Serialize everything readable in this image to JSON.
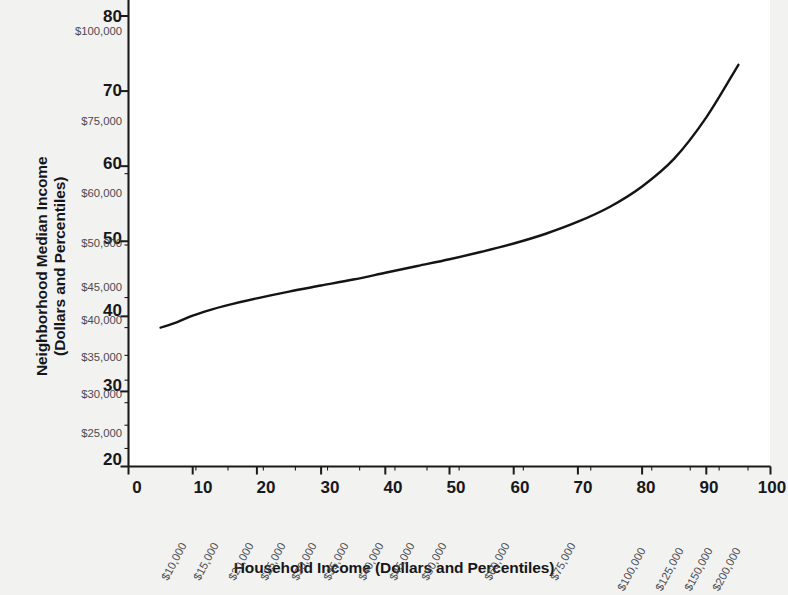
{
  "chart_data": {
    "type": "line",
    "title": "",
    "xlabel": "Household Income (Dollars and Percentiles)",
    "ylabel": "Neighborhood Median Income (Dollars and Percentiles)",
    "xlim": [
      0,
      100
    ],
    "ylim": [
      20,
      80
    ],
    "grid": false,
    "legend": "none",
    "x_tick_labels_percentile": [
      "0",
      "10",
      "20",
      "30",
      "40",
      "50",
      "60",
      "70",
      "80",
      "90",
      "100"
    ],
    "x_tick_values_percentile": [
      0,
      10,
      20,
      30,
      40,
      50,
      60,
      70,
      80,
      90,
      100
    ],
    "x_tick_labels_dollar": [
      "$10,000",
      "$15,000",
      "$20,000",
      "$25,000",
      "$30,000",
      "$35,000",
      "$40,000",
      "$45,000",
      "$50,000",
      "$60,000",
      "$75,000",
      "$100,000",
      "$125,000",
      "$150,000",
      "$200,000"
    ],
    "x_tick_dollar_positions": [
      10.5,
      15.5,
      21.0,
      26.0,
      31.0,
      36.0,
      41.5,
      46.5,
      51.5,
      61.5,
      72.0,
      81.5,
      87.5,
      92.0,
      96.5
    ],
    "y_tick_labels_percentile": [
      "20",
      "30",
      "40",
      "50",
      "60",
      "70",
      "80"
    ],
    "y_tick_values_percentile": [
      20,
      30,
      40,
      50,
      60,
      70,
      80
    ],
    "y_tick_labels_dollar": [
      "$25,000",
      "$30,000",
      "$35,000",
      "$40,000",
      "$45,000",
      "$50,000",
      "$60,000",
      "$75,000",
      "$100,000"
    ],
    "y_tick_dollar_positions": [
      22.4,
      25.5,
      28.5,
      31.5,
      34.8,
      38.5,
      42.5,
      49.5,
      59.0
    ],
    "series": [
      {
        "name": "Neighborhood median income by household income percentile",
        "x": [
          5.0,
          7.5,
          10,
          12.5,
          15,
          20,
          25,
          30,
          35,
          40,
          45,
          50,
          55,
          60,
          65,
          70,
          75,
          80,
          85,
          90,
          95
        ],
        "y": [
          38.5,
          39.2,
          40.1,
          40.8,
          41.4,
          42.4,
          43.3,
          44.1,
          44.9,
          45.8,
          46.7,
          47.6,
          48.6,
          49.7,
          51.0,
          52.6,
          54.6,
          57.3,
          61.0,
          66.5,
          73.5
        ]
      }
    ]
  },
  "axes": {
    "y_title": "Neighborhood Median Income\n(Dollars and Percentiles)",
    "y_title_line1": "Neighborhood Median Income",
    "y_title_line2": "(Dollars and Percentiles)",
    "x_title": "Household Income (Dollars and Percentiles)"
  },
  "colors": {
    "background": "#f2f2f0",
    "plot_background": "#ffffff",
    "axis": "#1a1a1a",
    "curve": "#141418",
    "tick_label_major": "#18181c",
    "tick_label_dollar": "#4a4a50"
  }
}
